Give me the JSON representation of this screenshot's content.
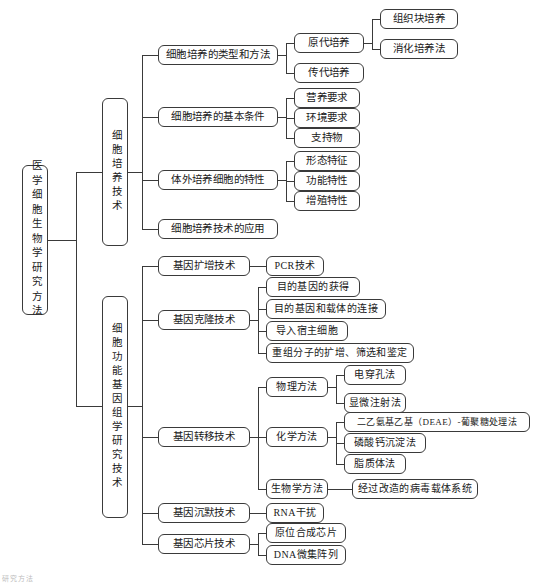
{
  "diagram": {
    "title": "医学细胞生物学研究方法",
    "type": "mindmap-tree",
    "caption": "研究方法",
    "line_color": "#3a3a3a",
    "node_border_color": "#3a3a3a",
    "background": "#ffffff"
  },
  "root": {
    "label": "医学细胞生物学研究方法"
  },
  "branch1": {
    "label": "细胞培养技术",
    "children": [
      {
        "label": "细胞培养的类型和方法",
        "children": [
          {
            "label": "原代培养",
            "children": [
              {
                "label": "组织块培养"
              },
              {
                "label": "消化培养法"
              }
            ]
          },
          {
            "label": "传代培养"
          }
        ]
      },
      {
        "label": "细胞培养的基本条件",
        "children": [
          {
            "label": "营养要求"
          },
          {
            "label": "环境要求"
          },
          {
            "label": "支持物"
          }
        ]
      },
      {
        "label": "体外培养细胞的特性",
        "children": [
          {
            "label": "形态特征"
          },
          {
            "label": "功能特性"
          },
          {
            "label": "增殖特性"
          }
        ]
      },
      {
        "label": "细胞培养技术的应用",
        "children": []
      }
    ]
  },
  "branch2": {
    "label": "细胞功能基因组学研究技术",
    "children": [
      {
        "label": "基因扩增技术",
        "children": [
          {
            "label": "PCR技术"
          }
        ]
      },
      {
        "label": "基因克隆技术",
        "children": [
          {
            "label": "目的基因的获得"
          },
          {
            "label": "目的基因和载体的连接"
          },
          {
            "label": "导入宿主细胞"
          },
          {
            "label": "重组分子的扩增、筛选和鉴定"
          }
        ]
      },
      {
        "label": "基因转移技术",
        "children": [
          {
            "label": "物理方法",
            "children": [
              {
                "label": "电穿孔法"
              },
              {
                "label": "显微注射法"
              }
            ]
          },
          {
            "label": "化学方法",
            "children": [
              {
                "label": "二乙氨基乙基（DEAE）-葡聚糖处理法"
              },
              {
                "label": "磷酸钙沉淀法"
              },
              {
                "label": "脂质体法"
              }
            ]
          },
          {
            "label": "生物学方法",
            "children": [
              {
                "label": "经过改造的病毒载体系统"
              }
            ]
          }
        ]
      },
      {
        "label": "基因沉默技术",
        "children": [
          {
            "label": "RNA干扰"
          }
        ]
      },
      {
        "label": "基因芯片技术",
        "children": [
          {
            "label": "原位合成芯片"
          },
          {
            "label": "DNA微集阵列"
          }
        ]
      }
    ]
  }
}
